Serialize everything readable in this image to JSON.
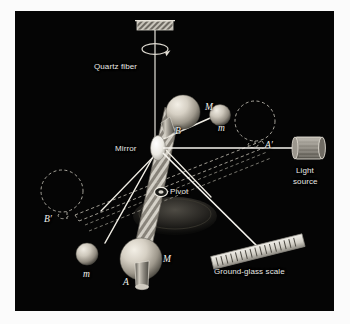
{
  "figure": {
    "panel_background": "#050505",
    "page_background": "#fbfbfb",
    "label_color": "#e8e8e4",
    "beam_color": "#f5f5f0",
    "sphere_color": "#cfcac0",
    "ghost_color": "#b9b5ab"
  },
  "labels": {
    "quartz_fiber": "Quartz fiber",
    "mirror": "Mirror",
    "pivot": "Pivot",
    "light_source_line1": "Light",
    "light_source_line2": "source",
    "ground_glass_scale": "Ground-glass scale"
  },
  "symbols": {
    "upper_large_mass": "M",
    "upper_small_mass": "m",
    "upper_rod_end": "B",
    "lower_large_mass": "M",
    "lower_small_mass": "m",
    "lower_rod_end": "A",
    "ghost_upper_right": "A′",
    "ghost_lower_left": "B′"
  },
  "components": [
    {
      "name": "ceiling-bracket",
      "kind": "support"
    },
    {
      "name": "quartz-fiber",
      "kind": "fiber"
    },
    {
      "name": "rotation-arrow",
      "kind": "annotation"
    },
    {
      "name": "mirror-disk",
      "kind": "optic"
    },
    {
      "name": "torsion-rod",
      "kind": "beam"
    },
    {
      "name": "pivot-ring",
      "kind": "joint"
    },
    {
      "name": "base-mound",
      "kind": "support"
    },
    {
      "name": "large-mass-upper",
      "kind": "mass",
      "symbol": "M"
    },
    {
      "name": "small-mass-upper",
      "kind": "mass",
      "symbol": "m"
    },
    {
      "name": "large-mass-lower",
      "kind": "mass",
      "symbol": "M"
    },
    {
      "name": "small-mass-lower",
      "kind": "mass",
      "symbol": "m"
    },
    {
      "name": "light-source-lamp",
      "kind": "source"
    },
    {
      "name": "incident-light-beam",
      "kind": "ray"
    },
    {
      "name": "reflected-light-beam",
      "kind": "ray"
    },
    {
      "name": "ground-glass-scale-bar",
      "kind": "detector"
    },
    {
      "name": "ghost-position-a-prime",
      "kind": "ghost",
      "symbol": "A′"
    },
    {
      "name": "ghost-position-b-prime",
      "kind": "ghost",
      "symbol": "B′"
    }
  ],
  "scale_bar": {
    "tick_count": 17
  }
}
